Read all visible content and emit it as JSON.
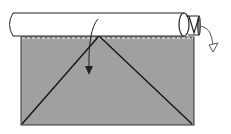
{
  "diagram": {
    "type": "folding-instruction",
    "colors": {
      "paper": "#a0a0a0",
      "tube": "#ffffff",
      "stroke": "#222222",
      "fold_line": "#ffffff",
      "background": "#ffffff"
    },
    "elements": {
      "paper_sheet": "gray-rectangle",
      "crease_lines": [
        "left-diagonal",
        "right-diagonal"
      ],
      "rolled_tube": "cylinder",
      "fold_arrow": "down-arrow",
      "turn_arrow": "curved-arrow-right"
    }
  }
}
